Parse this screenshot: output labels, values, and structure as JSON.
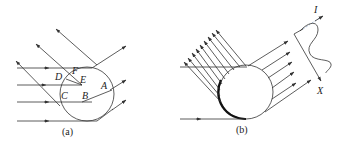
{
  "panel_a": {
    "caption": "(a)",
    "points": {
      "A": "A",
      "B": "B",
      "C": "C",
      "D": "D",
      "E": "E",
      "F": "F"
    }
  },
  "panel_b": {
    "caption": "(b)",
    "axis_I": "I",
    "axis_X": "X"
  },
  "colors": {
    "line": "#333333",
    "background": "#ffffff",
    "dashed_segment": "#8fa8c8"
  }
}
